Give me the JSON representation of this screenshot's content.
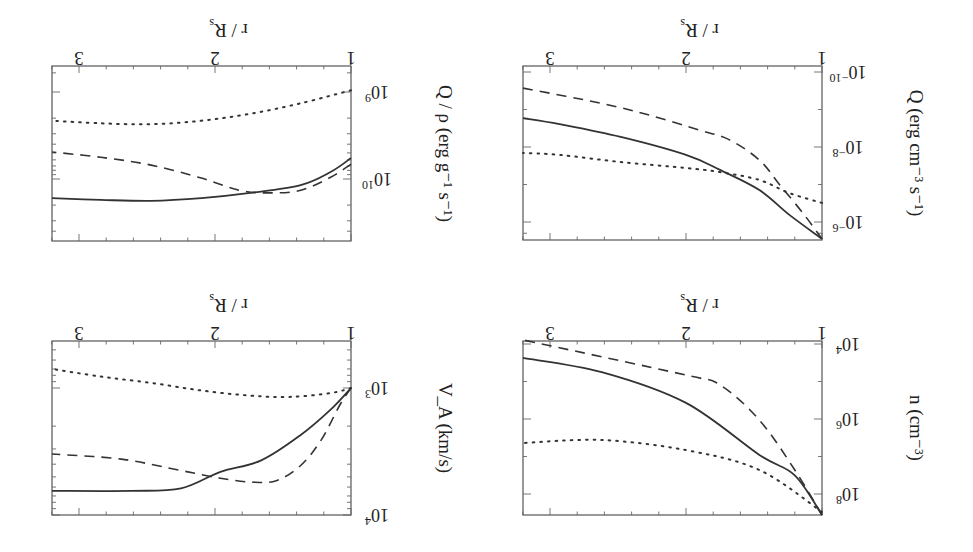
{
  "figure": {
    "orientation_note": "Figure rendered rotated 180 degrees",
    "rotation_deg": 180
  },
  "chart_data": [
    {
      "type": "line",
      "panel": "top-left",
      "title": "",
      "xlabel": "r / R_s",
      "ylabel": "Q / ρ (erg g^-1 s^-1)",
      "xlim": [
        1,
        3.2
      ],
      "x_ticks": [
        1,
        2,
        3
      ],
      "yscale": "log",
      "ylim_log10": [
        8.72,
        10.72
      ],
      "y_ticks_log10": [
        9,
        10
      ],
      "y_tick_labels": [
        "10^9",
        "10^10"
      ],
      "series": [
        {
          "name": "solid",
          "style": "solid",
          "r": [
            1,
            1.15,
            1.37,
            1.74,
            2.1,
            2.47,
            2.84,
            3.2
          ],
          "log10_y": [
            9.76,
            9.92,
            10.07,
            10.16,
            10.22,
            10.25,
            10.24,
            10.22
          ]
        },
        {
          "name": "dashed",
          "style": "dashed",
          "r": [
            1,
            1.15,
            1.37,
            1.6,
            1.82,
            2.1,
            2.47,
            2.84,
            3.2
          ],
          "log10_y": [
            9.83,
            9.98,
            10.13,
            10.16,
            10.13,
            9.99,
            9.84,
            9.75,
            9.69
          ]
        },
        {
          "name": "dotted",
          "style": "dotted",
          "r": [
            1,
            1.37,
            1.74,
            2.1,
            2.47,
            2.84,
            3.2
          ],
          "log10_y": [
            8.98,
            9.13,
            9.25,
            9.33,
            9.37,
            9.36,
            9.33
          ]
        }
      ]
    },
    {
      "type": "line",
      "panel": "top-right",
      "title": "",
      "xlabel": "r / R_s",
      "ylabel": "Q (erg cm^-3 s^-1)",
      "xlim": [
        1,
        3.2
      ],
      "x_ticks": [
        1,
        2,
        3
      ],
      "yscale": "log",
      "ylim_log10": [
        -10.16,
        -5.5
      ],
      "y_ticks_log10": [
        -10,
        -8,
        -6
      ],
      "y_tick_labels": [
        "10^-10",
        "10^-8",
        "10^-6"
      ],
      "series": [
        {
          "name": "solid",
          "style": "solid",
          "r": [
            1,
            1.24,
            1.46,
            1.75,
            2,
            2.48,
            2.93,
            3.2
          ],
          "log10_y": [
            -5.55,
            -6.19,
            -6.85,
            -7.39,
            -7.79,
            -8.27,
            -8.61,
            -8.77
          ]
        },
        {
          "name": "dashed",
          "style": "dashed",
          "r": [
            1,
            1.13,
            1.31,
            1.46,
            1.68,
            1.9,
            2.27,
            2.63,
            3.2
          ],
          "log10_y": [
            -5.55,
            -6.19,
            -6.99,
            -7.65,
            -8.19,
            -8.45,
            -8.85,
            -9.17,
            -9.57
          ]
        },
        {
          "name": "dotted",
          "style": "dotted",
          "r": [
            1,
            1.24,
            1.46,
            1.75,
            2,
            2.48,
            2.93,
            3.2
          ],
          "log10_y": [
            -6.51,
            -6.77,
            -7.12,
            -7.33,
            -7.44,
            -7.6,
            -7.79,
            -7.84
          ]
        }
      ]
    },
    {
      "type": "line",
      "panel": "bottom-left",
      "title": "",
      "xlabel": "r / R_s",
      "ylabel": "V_A (km/s)",
      "xlim": [
        1,
        3.2
      ],
      "x_ticks": [
        1,
        2,
        3
      ],
      "yscale": "log",
      "ylim_log10": [
        2.63,
        4.0
      ],
      "y_ticks_log10": [
        3,
        4
      ],
      "y_tick_labels": [
        "10^3",
        "10^4"
      ],
      "series": [
        {
          "name": "solid",
          "style": "solid",
          "r": [
            1,
            1.15,
            1.37,
            1.66,
            1.96,
            2.25,
            2.62,
            3.2
          ],
          "log10_y": [
            3.0,
            3.17,
            3.37,
            3.57,
            3.66,
            3.79,
            3.81,
            3.81
          ]
        },
        {
          "name": "dashed",
          "style": "dashed",
          "r": [
            1,
            1.08,
            1.22,
            1.37,
            1.55,
            1.74,
            1.96,
            2.25,
            2.69,
            3.2
          ],
          "log10_y": [
            3.0,
            3.13,
            3.41,
            3.61,
            3.73,
            3.74,
            3.71,
            3.65,
            3.56,
            3.52
          ]
        },
        {
          "name": "dotted",
          "style": "dotted",
          "r": [
            1,
            1.15,
            1.45,
            1.74,
            2.1,
            2.47,
            2.84,
            3.2
          ],
          "log10_y": [
            3.0,
            3.04,
            3.07,
            3.06,
            3.02,
            2.96,
            2.91,
            2.85
          ]
        }
      ]
    },
    {
      "type": "line",
      "panel": "bottom-right",
      "title": "",
      "xlabel": "r / R_s",
      "ylabel": "n (cm^-3)",
      "xlim": [
        1,
        3.2
      ],
      "x_ticks": [
        1,
        2,
        3
      ],
      "yscale": "log",
      "ylim_log10": [
        3.92,
        8.56
      ],
      "y_ticks_log10": [
        4,
        6,
        8
      ],
      "y_tick_labels": [
        "10^4",
        "10^6",
        "10^8"
      ],
      "series": [
        {
          "name": "solid",
          "style": "solid",
          "r": [
            1,
            1.2,
            1.46,
            2,
            2.62,
            3.2
          ],
          "log10_y": [
            8.56,
            7.5,
            6.96,
            5.57,
            4.75,
            4.37
          ]
        },
        {
          "name": "dashed",
          "style": "dashed",
          "r": [
            1,
            1.2,
            1.46,
            1.75,
            2,
            3.2
          ],
          "log10_y": [
            8.56,
            7.36,
            6.03,
            5.09,
            4.83,
            3.89
          ]
        },
        {
          "name": "dotted",
          "style": "dotted",
          "r": [
            1,
            1.46,
            2,
            2.62,
            3.2
          ],
          "log10_y": [
            8.48,
            7.36,
            6.83,
            6.56,
            6.64
          ]
        }
      ]
    }
  ],
  "panels": [
    {
      "id": "q-over-rho",
      "box": {
        "x0": 52,
        "x1": 351,
        "y0": 66,
        "y1": 241
      },
      "y_map": {
        "ref_log": 9,
        "ref_px": 92,
        "px_per_decade": 87
      },
      "x_map": {
        "r1_px": 351,
        "px_per_unit": 136
      },
      "x_tick_labels": [
        "1",
        "2",
        "3"
      ],
      "y_tick_label_parts": [
        {
          "base": "10",
          "exp": "9"
        },
        {
          "base": "10",
          "exp": "10"
        }
      ],
      "xlabel_parts": {
        "main": "r / R",
        "sub": "s"
      },
      "ylabel_text": "Q / ρ (erg g⁻¹ s⁻¹)",
      "minor_y_logs": [
        8.78,
        9.3,
        9.48,
        9.6,
        9.7,
        9.78,
        9.85,
        9.9,
        9.95,
        10.3,
        10.48,
        10.6
      ]
    },
    {
      "id": "q",
      "box": {
        "x0": 523,
        "x1": 822,
        "y0": 66,
        "y1": 240
      },
      "y_map": {
        "ref_log": -10,
        "ref_px": 72,
        "px_per_decade": 37.5
      },
      "x_map": {
        "r1_px": 822,
        "px_per_unit": 136
      },
      "x_tick_labels": [
        "1",
        "2",
        "3"
      ],
      "y_tick_label_parts": [
        {
          "base": "10",
          "exp": "−10"
        },
        {
          "base": "10",
          "exp": "−8"
        },
        {
          "base": "10",
          "exp": "−6"
        }
      ],
      "xlabel_parts": {
        "main": "r / R",
        "sub": "s"
      },
      "ylabel_text": "Q (erg cm⁻³ s⁻¹)",
      "minor_y_logs": [
        -9,
        -7,
        -5.7
      ]
    },
    {
      "id": "va",
      "box": {
        "x0": 52,
        "x1": 351,
        "y0": 341,
        "y1": 515
      },
      "y_map": {
        "ref_log": 3,
        "ref_px": 388,
        "px_per_decade": 127
      },
      "x_map": {
        "r1_px": 351,
        "px_per_unit": 136
      },
      "x_tick_labels": [
        "1",
        "2",
        "3"
      ],
      "y_tick_label_parts": [
        {
          "base": "10",
          "exp": "3"
        },
        {
          "base": "10",
          "exp": "4"
        }
      ],
      "xlabel_parts": {
        "main": "r / R",
        "sub": "s"
      },
      "ylabel_text": "V_A (km/s)",
      "minor_y_logs": [
        2.7,
        2.78,
        2.85,
        2.9,
        2.95,
        3.3,
        3.48,
        3.6,
        3.7,
        3.78,
        3.85,
        3.9,
        3.95
      ]
    },
    {
      "id": "n",
      "box": {
        "x0": 523,
        "x1": 822,
        "y0": 341,
        "y1": 515
      },
      "y_map": {
        "ref_log": 4,
        "ref_px": 344,
        "px_per_decade": 37.5
      },
      "x_map": {
        "r1_px": 822,
        "px_per_unit": 136
      },
      "x_tick_labels": [
        "1",
        "2",
        "3"
      ],
      "y_tick_label_parts": [
        {
          "base": "10",
          "exp": "4"
        },
        {
          "base": "10",
          "exp": "6"
        },
        {
          "base": "10",
          "exp": "8"
        }
      ],
      "xlabel_parts": {
        "main": "r / R",
        "sub": "s"
      },
      "ylabel_text": "n (cm⁻³)",
      "minor_y_logs": [
        5,
        7
      ]
    }
  ]
}
